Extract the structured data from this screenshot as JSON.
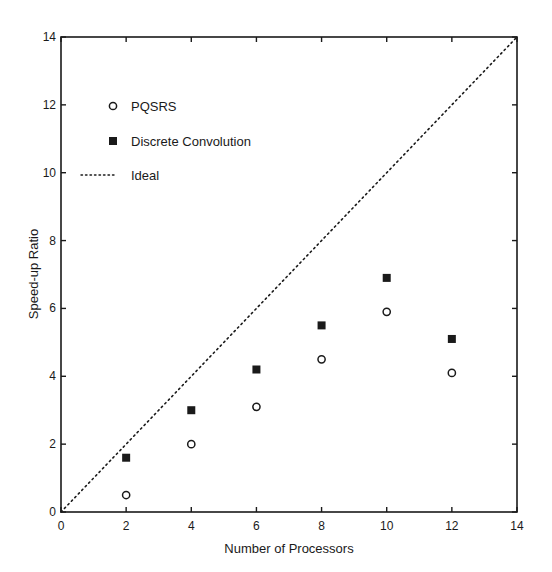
{
  "chart_data": {
    "type": "scatter",
    "title": "",
    "xlabel": "Number of Processors",
    "ylabel": "Speed-up Ratio",
    "xlim": [
      0,
      14
    ],
    "ylim": [
      0,
      14
    ],
    "xticks": [
      0,
      2,
      4,
      6,
      8,
      10,
      12,
      14
    ],
    "yticks": [
      0,
      2,
      4,
      6,
      8,
      10,
      12,
      14
    ],
    "grid": false,
    "legend_position": "upper-left-inside",
    "x": [
      2,
      4,
      6,
      8,
      10,
      12
    ],
    "series": [
      {
        "name": "PQSRS",
        "marker": "open-circle",
        "values": [
          0.5,
          2.0,
          3.1,
          4.5,
          5.9,
          4.1
        ]
      },
      {
        "name": "Discrete Convolution",
        "marker": "filled-square",
        "values": [
          1.6,
          3.0,
          4.2,
          5.5,
          6.9,
          5.1
        ]
      },
      {
        "name": "Ideal",
        "marker": "dotted-line",
        "line": [
          [
            0,
            0
          ],
          [
            14,
            14
          ]
        ]
      }
    ]
  },
  "colors": {
    "ink": "#1a1a1a",
    "background": "#ffffff"
  }
}
